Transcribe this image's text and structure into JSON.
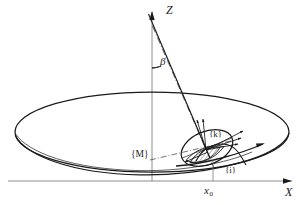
{
  "figure": {
    "type": "technical-line-diagram",
    "background_color": "#ffffff",
    "line_color": "#1a1a1a",
    "labels": {
      "axis_z": "Z",
      "axis_x": "X",
      "angle_beta": "β",
      "frame_m": "{M}",
      "frame_k": "{k}",
      "frame_i": "{i}",
      "position_x0": "x",
      "position_x0_sub": "0"
    },
    "elements": {
      "large_ellipse": "large-ellipse-disc",
      "lower_rim_curve": "lower-rim-curve",
      "small_ellipse": "small-ellipse-k-frame",
      "hatched_region": "hatched-contact-region",
      "tilt_axis_line": "tilt-axis-line",
      "dash_dot_line": "dash-dot-center-line",
      "beta_arc": "beta-angle-arc",
      "vertical_z_axis": "vertical-z-axis",
      "horizontal_x_axis": "horizontal-x-axis",
      "x0_tick_line": "x0-tick-line",
      "direction_arrows": "k-frame-direction-arrows"
    },
    "geometry": {
      "large_ellipse_cx": 152,
      "large_ellipse_cy": 132,
      "large_ellipse_rx": 137,
      "large_ellipse_ry": 40,
      "small_ellipse_cx": 207,
      "small_ellipse_cy": 148,
      "small_ellipse_rx": 27,
      "small_ellipse_ry": 16,
      "small_ellipse_rotation": -22,
      "z_axis_x": 152,
      "x_axis_y": 181,
      "x0_x": 213,
      "beta_angle_deg": 18
    }
  }
}
